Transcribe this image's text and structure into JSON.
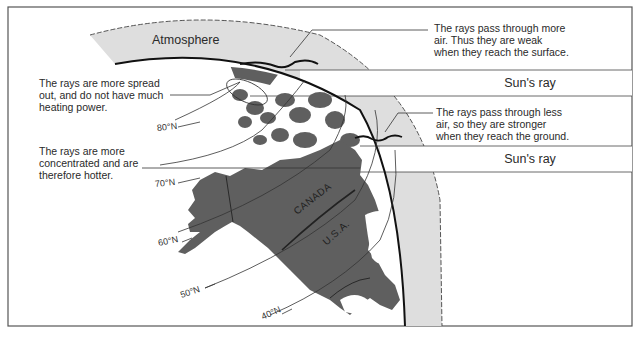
{
  "diagram": {
    "atmosphere_label": "Atmosphere",
    "annotations": {
      "top_right": "The rays pass through more\nair. Thus they are weak\nwhen they reach the surface.",
      "middle_right": "The rays pass through less\nair, so they are stronger\nwhen they reach the ground.",
      "upper_left": "The rays are more spread\nout, and do not have much\nheating power.",
      "lower_left": "The rays are more\nconcentrated and are\ntherefore hotter."
    },
    "sun_rays": [
      {
        "label": "Sun's ray"
      },
      {
        "label": "Sun's ray"
      }
    ],
    "latitudes": [
      "80°N",
      "70°N",
      "60°N",
      "50°N",
      "40°N"
    ],
    "countries": [
      "CANADA",
      "U.S.A."
    ],
    "colors": {
      "land": "#5f5f5f",
      "atmosphere": "#dedede",
      "frame": "#555555",
      "lines": "#333333"
    }
  }
}
